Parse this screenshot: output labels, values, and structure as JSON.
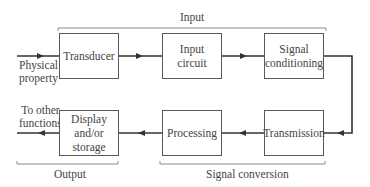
{
  "diagram": {
    "type": "block-diagram",
    "groups": {
      "input": "Input",
      "output": "Output",
      "signal_conversion": "Signal conversion"
    },
    "external": {
      "input_signal": [
        "Physical",
        "property"
      ],
      "output_signal": [
        "To other",
        "functions"
      ]
    },
    "blocks": {
      "transducer": "Transducer",
      "input_circuit": [
        "Input",
        "circuit"
      ],
      "signal_conditioning": [
        "Signal",
        "conditioning"
      ],
      "transmission": "Transmission",
      "processing": "Processing",
      "display_storage": [
        "Display",
        "and/or",
        "storage"
      ]
    },
    "flow": [
      "Physical property",
      "Transducer",
      "Input circuit",
      "Signal conditioning",
      "Transmission",
      "Processing",
      "Display and/or storage",
      "To other functions"
    ],
    "colors": {
      "line": "#3a3a3a",
      "box_border": "#5a5a5a",
      "bracket": "#8a8a8a"
    }
  }
}
